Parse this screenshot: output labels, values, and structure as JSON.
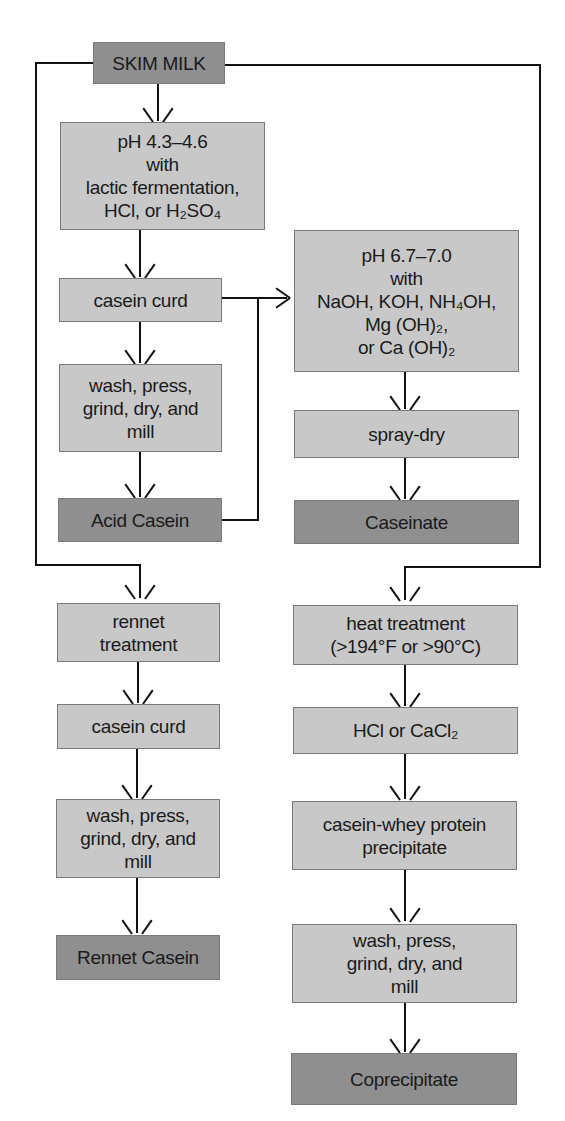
{
  "diagram": {
    "source": {
      "label": "SKIM MILK"
    },
    "acid_casein_branch": {
      "steps": [
        {
          "lines": [
            "pH 4.3–4.6",
            "with",
            "lactic fermentation,",
            "HCl, or H₂SO₄"
          ]
        },
        {
          "lines": [
            "casein curd"
          ]
        },
        {
          "lines": [
            "wash, press,",
            "grind, dry, and",
            "mill"
          ]
        }
      ],
      "product": "Acid Casein"
    },
    "caseinate_branch": {
      "steps": [
        {
          "lines": [
            "pH 6.7–7.0",
            "with",
            "NaOH, KOH, NH₄OH,",
            "Mg (OH)₂,",
            "or Ca (OH)₂"
          ]
        },
        {
          "lines": [
            "spray-dry"
          ]
        }
      ],
      "product": "Caseinate"
    },
    "rennet_casein_branch": {
      "steps": [
        {
          "lines": [
            "rennet",
            "treatment"
          ]
        },
        {
          "lines": [
            "casein curd"
          ]
        },
        {
          "lines": [
            "wash, press,",
            "grind, dry, and",
            "mill"
          ]
        }
      ],
      "product": "Rennet Casein"
    },
    "coprecipitate_branch": {
      "steps": [
        {
          "lines": [
            "heat treatment",
            "(>194°F or >90°C)"
          ]
        },
        {
          "lines": [
            "HCl or CaCl₂"
          ]
        },
        {
          "lines": [
            "casein-whey protein",
            "precipitate"
          ]
        },
        {
          "lines": [
            "wash, press,",
            "grind, dry, and",
            "mill"
          ]
        }
      ],
      "product": "Coprecipitate"
    },
    "colors": {
      "step_box": "#c8c8c8",
      "product_box": "#8f8f8f",
      "line": "#111111",
      "background": "#ffffff"
    }
  }
}
